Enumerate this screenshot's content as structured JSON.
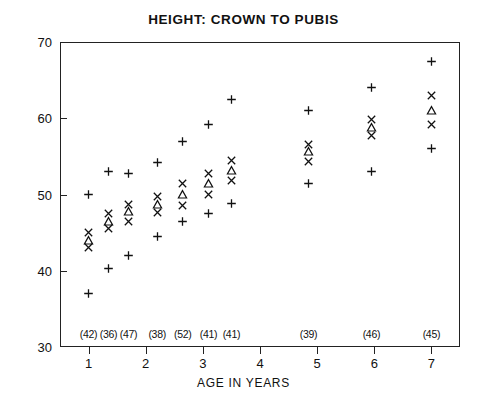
{
  "chart_data": {
    "type": "scatter",
    "title": "HEIGHT: CROWN TO PUBIS",
    "xlabel": "AGE IN YEARS",
    "ylabel": "",
    "xlim": [
      0.5,
      7.5
    ],
    "ylim": [
      30,
      70
    ],
    "x_ticks": [
      1,
      2,
      3,
      4,
      5,
      6,
      7
    ],
    "y_ticks": [
      30,
      40,
      50,
      60,
      70
    ],
    "grid": false,
    "legend": "none",
    "marker_meaning": {
      "plus": "upper / lower percentile bound",
      "cross": "upper / lower quartile or mean band",
      "triangle": "median"
    },
    "sample_size_labels": [
      "(42)",
      "(36)",
      "(47)",
      "(38)",
      "(52)",
      "(41)",
      "(41)",
      "(39)",
      "(46)",
      "(45)"
    ],
    "series": [
      {
        "name": "group-1",
        "x": 1.0,
        "n": "(42)",
        "points": [
          {
            "marker": "plus",
            "y": 50.0
          },
          {
            "marker": "cross",
            "y": 45.0
          },
          {
            "marker": "triangle",
            "y": 44.0
          },
          {
            "marker": "cross",
            "y": 43.0
          },
          {
            "marker": "plus",
            "y": 37.0
          }
        ]
      },
      {
        "name": "group-2",
        "x": 1.35,
        "n": "(36)",
        "points": [
          {
            "marker": "plus",
            "y": 53.0
          },
          {
            "marker": "cross",
            "y": 47.5
          },
          {
            "marker": "triangle",
            "y": 46.5
          },
          {
            "marker": "cross",
            "y": 45.5
          },
          {
            "marker": "plus",
            "y": 40.3
          }
        ]
      },
      {
        "name": "group-3",
        "x": 1.7,
        "n": "(47)",
        "points": [
          {
            "marker": "plus",
            "y": 52.8
          },
          {
            "marker": "cross",
            "y": 48.7
          },
          {
            "marker": "triangle",
            "y": 47.8
          },
          {
            "marker": "cross",
            "y": 46.5
          },
          {
            "marker": "plus",
            "y": 42.0
          }
        ]
      },
      {
        "name": "group-4",
        "x": 2.2,
        "n": "(38)",
        "points": [
          {
            "marker": "plus",
            "y": 54.2
          },
          {
            "marker": "cross",
            "y": 49.8
          },
          {
            "marker": "triangle",
            "y": 48.7
          },
          {
            "marker": "cross",
            "y": 47.6
          },
          {
            "marker": "plus",
            "y": 44.5
          }
        ]
      },
      {
        "name": "group-5",
        "x": 2.65,
        "n": "(52)",
        "points": [
          {
            "marker": "plus",
            "y": 57.0
          },
          {
            "marker": "cross",
            "y": 51.5
          },
          {
            "marker": "triangle",
            "y": 50.0
          },
          {
            "marker": "cross",
            "y": 48.6
          },
          {
            "marker": "plus",
            "y": 46.4
          }
        ]
      },
      {
        "name": "group-6",
        "x": 3.1,
        "n": "(41)",
        "points": [
          {
            "marker": "plus",
            "y": 59.2
          },
          {
            "marker": "cross",
            "y": 52.8
          },
          {
            "marker": "triangle",
            "y": 51.4
          },
          {
            "marker": "cross",
            "y": 50.0
          },
          {
            "marker": "plus",
            "y": 47.5
          }
        ]
      },
      {
        "name": "group-7",
        "x": 3.5,
        "n": "(41)",
        "points": [
          {
            "marker": "plus",
            "y": 62.5
          },
          {
            "marker": "cross",
            "y": 54.5
          },
          {
            "marker": "triangle",
            "y": 53.2
          },
          {
            "marker": "cross",
            "y": 51.8
          },
          {
            "marker": "plus",
            "y": 48.8
          }
        ]
      },
      {
        "name": "group-8",
        "x": 4.85,
        "n": "(39)",
        "points": [
          {
            "marker": "plus",
            "y": 61.0
          },
          {
            "marker": "cross",
            "y": 56.5
          },
          {
            "marker": "triangle",
            "y": 55.6
          },
          {
            "marker": "cross",
            "y": 54.3
          },
          {
            "marker": "plus",
            "y": 51.5
          }
        ]
      },
      {
        "name": "group-9",
        "x": 5.95,
        "n": "(46)",
        "points": [
          {
            "marker": "plus",
            "y": 64.0
          },
          {
            "marker": "cross",
            "y": 59.8
          },
          {
            "marker": "triangle",
            "y": 58.8
          },
          {
            "marker": "cross",
            "y": 57.8
          },
          {
            "marker": "plus",
            "y": 53.0
          }
        ]
      },
      {
        "name": "group-10",
        "x": 7.0,
        "n": "(45)",
        "points": [
          {
            "marker": "plus",
            "y": 67.5
          },
          {
            "marker": "cross",
            "y": 63.0
          },
          {
            "marker": "triangle",
            "y": 61.0
          },
          {
            "marker": "cross",
            "y": 59.2
          },
          {
            "marker": "plus",
            "y": 56.0
          }
        ]
      }
    ]
  }
}
